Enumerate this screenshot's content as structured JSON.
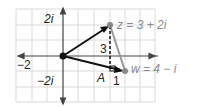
{
  "diagram": {
    "axis_labels": {
      "y_pos": "2i",
      "y_neg": "−2i",
      "x_neg": "−2"
    },
    "points": {
      "z": {
        "label": "z = 3 + 2i",
        "re": 3,
        "im": 2
      },
      "w": {
        "label": "w = 4 − i",
        "re": 4,
        "im": -1
      }
    },
    "annotations": {
      "height": "3",
      "base": "1",
      "angle_label": "A"
    },
    "colors": {
      "grid": "#d9d9d9",
      "axis": "#444444",
      "vector": "#111111",
      "segment": "#999999",
      "label_gray": "#8a8a8a"
    }
  }
}
